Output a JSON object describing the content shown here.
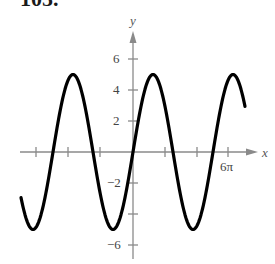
{
  "problem_number": "105.",
  "chart_data": {
    "type": "line",
    "title": "",
    "xlabel": "x",
    "ylabel": "y",
    "function": "y = 5 sin(2x/5)",
    "xlim": [
      "-7π",
      "7π"
    ],
    "ylim": [
      -7,
      7
    ],
    "x_ticks": [
      "-6π",
      "-4π",
      "-2π",
      "2π",
      "4π",
      "6π"
    ],
    "x_tick_labels_shown": [
      "6π"
    ],
    "y_ticks": [
      6,
      4,
      2,
      -2,
      -4,
      -6
    ],
    "y_tick_labels_shown": [
      "6",
      "4",
      "2",
      "−2",
      "−6"
    ],
    "grid": false,
    "legend": null,
    "series": [
      {
        "name": "curve",
        "amplitude": 5,
        "period": "5π",
        "x_in_pi": [
          -7,
          -6.25,
          -5,
          -3.75,
          -2.5,
          -1.25,
          0,
          1.25,
          2.5,
          3.75,
          5,
          6.25,
          7
        ],
        "y": [
          -2.94,
          -5,
          0,
          5,
          0,
          -5,
          0,
          5,
          0,
          -5,
          0,
          5,
          2.94
        ]
      }
    ],
    "colors": {
      "curve": "#000000",
      "axes": "#8a8a8a",
      "text": "#444444"
    }
  },
  "labels": {
    "y6": "6",
    "y4": "4",
    "y2": "2",
    "yn2": "−2",
    "yn6": "−6",
    "x6pi": "6π",
    "x": "x",
    "y": "y"
  }
}
